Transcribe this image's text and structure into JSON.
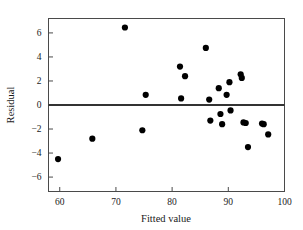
{
  "chart_data": {
    "type": "scatter",
    "title": "",
    "subtitle": "",
    "xlabel": "Fitted value",
    "ylabel": "Residual",
    "xlim": [
      58,
      100
    ],
    "ylim": [
      -7.2,
      7.2
    ],
    "xticks": [
      60,
      70,
      80,
      90,
      100
    ],
    "yticks": [
      6,
      4,
      2,
      0,
      -2,
      -4,
      -6
    ],
    "xtick_labels": [
      "60",
      "70",
      "80",
      "90",
      "100"
    ],
    "ytick_labels": [
      "6",
      "4",
      "2",
      "0",
      "−2",
      "−4",
      "−6"
    ],
    "grid": false,
    "legend": null,
    "annotations": [],
    "reference_lines": [
      {
        "name": "zero-residual-line",
        "orientation": "horizontal",
        "y": 0,
        "color": "#333333"
      }
    ],
    "marker": {
      "shape": "circle",
      "color": "#000000",
      "size": 3.1
    },
    "series": [
      {
        "name": "residuals",
        "color": "#000000",
        "points": [
          {
            "x": 59.7,
            "y": -4.5
          },
          {
            "x": 65.8,
            "y": -2.8
          },
          {
            "x": 71.6,
            "y": 6.45
          },
          {
            "x": 74.7,
            "y": -2.1
          },
          {
            "x": 75.3,
            "y": 0.85
          },
          {
            "x": 81.4,
            "y": 3.2
          },
          {
            "x": 81.6,
            "y": 0.55
          },
          {
            "x": 82.3,
            "y": 2.4
          },
          {
            "x": 86.0,
            "y": 4.75
          },
          {
            "x": 86.6,
            "y": 0.45
          },
          {
            "x": 86.8,
            "y": -1.3
          },
          {
            "x": 88.3,
            "y": 1.4
          },
          {
            "x": 88.6,
            "y": -0.75
          },
          {
            "x": 88.9,
            "y": -1.6
          },
          {
            "x": 89.7,
            "y": 0.85
          },
          {
            "x": 90.2,
            "y": 1.9
          },
          {
            "x": 90.4,
            "y": -0.45
          },
          {
            "x": 92.2,
            "y": 2.55
          },
          {
            "x": 92.4,
            "y": 2.25
          },
          {
            "x": 92.7,
            "y": -1.45
          },
          {
            "x": 93.1,
            "y": -1.5
          },
          {
            "x": 93.5,
            "y": -3.5
          },
          {
            "x": 96.0,
            "y": -1.55
          },
          {
            "x": 96.3,
            "y": -1.6
          },
          {
            "x": 97.1,
            "y": -2.45
          }
        ]
      }
    ]
  },
  "figure": {
    "background_color": "#ffffff",
    "frame_color": "#4a4a4a"
  }
}
